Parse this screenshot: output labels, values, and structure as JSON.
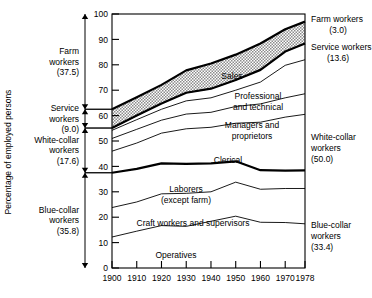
{
  "chart_data": {
    "type": "area",
    "title": "",
    "subtitle": "",
    "ylabel": "Percentage of employed persons",
    "xlabel": "",
    "x": [
      1900,
      1910,
      1920,
      1930,
      1940,
      1950,
      1960,
      1970,
      1978
    ],
    "xtick_labels": [
      "1900",
      "1910",
      "1920",
      "1930",
      "1940",
      "1950",
      "1960",
      "1970",
      "1978"
    ],
    "ytick_labels": [
      "0",
      "10",
      "20",
      "30",
      "40",
      "50",
      "60",
      "70",
      "80",
      "90",
      "100"
    ],
    "yticks": [
      0,
      10,
      20,
      30,
      40,
      50,
      60,
      70,
      80,
      90,
      100
    ],
    "ylim": [
      0,
      100
    ],
    "xlim": [
      1900,
      1978
    ],
    "grid": false,
    "legend": "none",
    "stacking": "cumulative-from-bottom",
    "note": "Cumulative upper boundaries of each stacked band, percent of employed persons",
    "series": [
      {
        "name": "Operatives",
        "label_in_plot": "Operatives",
        "cumulative_upper": [
          12.2,
          14.5,
          16.7,
          16.4,
          18.4,
          20.4,
          18.0,
          17.9,
          17.4
        ]
      },
      {
        "name": "Craft workers and supervisors",
        "label_in_plot": "Craft workers and supervisors",
        "cumulative_upper": [
          23.8,
          26.0,
          29.2,
          29.4,
          30.0,
          33.8,
          31.0,
          31.3,
          31.3
        ]
      },
      {
        "name": "Laborers (except farm)",
        "label_in_plot": "Laborers (except farm)",
        "cumulative_upper": [
          37.5,
          39.0,
          41.2,
          41.0,
          41.2,
          42.0,
          38.5,
          38.3,
          38.4
        ]
      },
      {
        "name": "Clerical",
        "label_in_plot": "Clerical",
        "cumulative_upper": [
          46.0,
          49.2,
          53.1,
          54.8,
          55.4,
          57.0,
          57.4,
          59.4,
          60.5
        ]
      },
      {
        "name": "Managers and proprietors",
        "label_in_plot": "Managers and proprietors",
        "cumulative_upper": [
          51.0,
          54.6,
          58.2,
          60.6,
          61.3,
          63.6,
          64.6,
          67.0,
          68.6
        ]
      },
      {
        "name": "Professional and technical",
        "label_in_plot": "Professional and technical",
        "cumulative_upper": [
          54.2,
          58.4,
          62.5,
          65.8,
          67.0,
          70.0,
          73.2,
          79.8,
          82.0
        ]
      },
      {
        "name": "Sales",
        "label_in_plot": "Sales",
        "cumulative_upper": [
          55.1,
          60.0,
          64.8,
          69.0,
          70.6,
          74.0,
          78.0,
          85.2,
          88.4
        ]
      },
      {
        "name": "Service workers",
        "label_in_plot": "",
        "pattern": "stipple",
        "cumulative_upper": [
          62.5,
          67.2,
          72.1,
          77.8,
          80.5,
          84.0,
          88.4,
          94.0,
          97.0
        ]
      },
      {
        "name": "Farm workers",
        "label_in_plot": "",
        "cumulative_upper": [
          100,
          100,
          100,
          100,
          100,
          100,
          100,
          100,
          100
        ]
      }
    ]
  },
  "left_brackets": [
    {
      "name": "farm-workers",
      "lines": [
        "Farm",
        "workers",
        "(37.5)"
      ],
      "value": "37.5",
      "from": 62.5,
      "to": 100
    },
    {
      "name": "service-workers",
      "lines": [
        "Service",
        "workers",
        "(9.0)"
      ],
      "value": "9.0",
      "from": 55.1,
      "to": 62.5
    },
    {
      "name": "white-collar-workers",
      "lines": [
        "White-collar",
        "workers",
        "(17.6)"
      ],
      "value": "17.6",
      "from": 37.5,
      "to": 55.1
    },
    {
      "name": "blue-collar-workers",
      "lines": [
        "Blue-collar",
        "workers",
        "(35.8)"
      ],
      "value": "35.8",
      "from": 0,
      "to": 37.5
    }
  ],
  "right_labels": [
    {
      "name": "farm-workers",
      "lines": [
        "Farm workers",
        "(3.0)"
      ],
      "value": "3.0"
    },
    {
      "name": "service-workers",
      "lines": [
        "Service workers",
        "(13.6)"
      ],
      "value": "13.6"
    },
    {
      "name": "white-collar-workers",
      "lines": [
        "White-collar",
        "workers",
        "(50.0)"
      ],
      "value": "50.0"
    },
    {
      "name": "blue-collar-workers",
      "lines": [
        "Blue-collar",
        "workers",
        "(33.4)"
      ],
      "value": "33.4"
    }
  ],
  "plot_labels": [
    {
      "name": "sales",
      "text": "Sales"
    },
    {
      "name": "professional-and-technical",
      "line1": "Professional",
      "line2": "and technical"
    },
    {
      "name": "managers-and-proprietors",
      "line1": "Managers and",
      "line2": "proprietors"
    },
    {
      "name": "clerical",
      "text": "Clerical"
    },
    {
      "name": "laborers-except-farm",
      "line1": "Laborers",
      "line2": "(except farm)"
    },
    {
      "name": "craft-workers",
      "text": "Craft workers and supervisors"
    },
    {
      "name": "operatives",
      "text": "Operatives"
    }
  ],
  "colors": {
    "ink": "#000000",
    "background": "#ffffff",
    "stipple": "#b0b0b0"
  }
}
